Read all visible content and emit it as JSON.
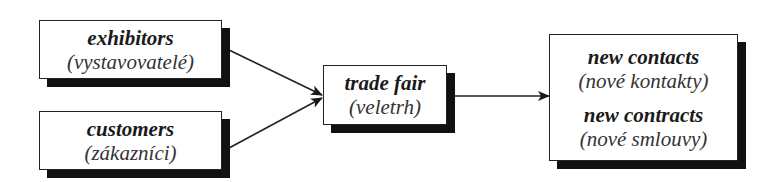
{
  "diagram": {
    "type": "flow",
    "nodes": [
      {
        "id": "exhibitors",
        "title": "exhibitors",
        "subtitle": "(vystavovatelé)"
      },
      {
        "id": "customers",
        "title": "customers",
        "subtitle": "(zákazníci)"
      },
      {
        "id": "trade_fair",
        "title": "trade fair",
        "subtitle": "(veletrh)"
      },
      {
        "id": "outcomes",
        "items": [
          {
            "title": "new contacts",
            "subtitle": "(nové kontakty)"
          },
          {
            "title": "new contracts",
            "subtitle": "(nové smlouvy)"
          }
        ]
      }
    ],
    "edges": [
      {
        "from": "exhibitors",
        "to": "trade_fair"
      },
      {
        "from": "customers",
        "to": "trade_fair"
      },
      {
        "from": "trade_fair",
        "to": "outcomes"
      }
    ],
    "colors": {
      "stroke": "#222222",
      "shadow": "#111111",
      "fill": "#ffffff"
    }
  }
}
